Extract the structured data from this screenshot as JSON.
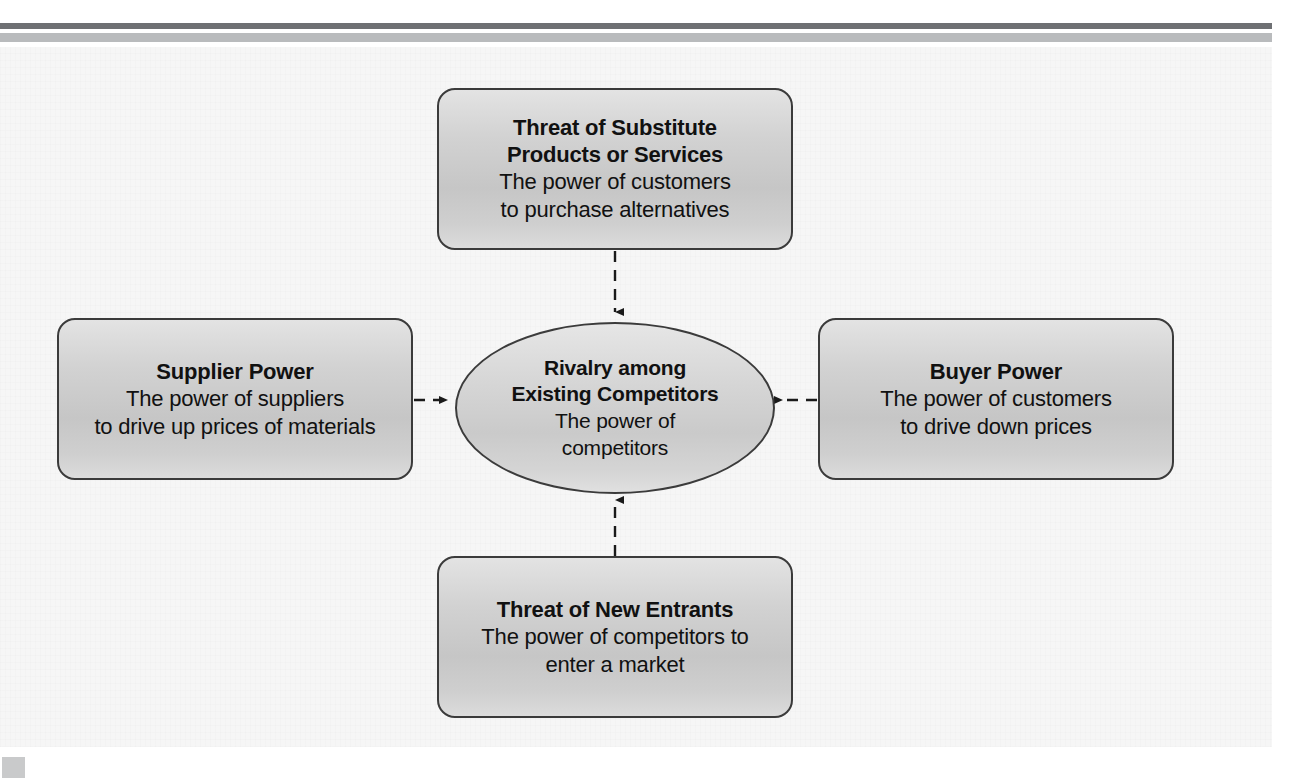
{
  "diagram": {
    "type": "porters-five-forces",
    "center": {
      "title_lines": [
        "Rivalry among",
        "Existing Competitors"
      ],
      "desc_lines": [
        "The power of",
        "competitors"
      ]
    },
    "nodes": [
      {
        "id": "top",
        "position": "top",
        "title_lines": [
          "Threat of Substitute",
          "Products or Services"
        ],
        "desc_lines": [
          "The power of customers",
          "to purchase alternatives"
        ],
        "arrow_direction": "down"
      },
      {
        "id": "left",
        "position": "left",
        "title_lines": [
          "Supplier Power"
        ],
        "desc_lines": [
          "The power of suppliers",
          "to drive up prices of materials"
        ],
        "arrow_direction": "right"
      },
      {
        "id": "right",
        "position": "right",
        "title_lines": [
          "Buyer Power"
        ],
        "desc_lines": [
          "The power of customers",
          "to drive down prices"
        ],
        "arrow_direction": "left"
      },
      {
        "id": "bottom",
        "position": "bottom",
        "title_lines": [
          "Threat of New Entrants"
        ],
        "desc_lines": [
          "The power of competitors to",
          "enter a market"
        ],
        "arrow_direction": "up"
      }
    ],
    "connector_style": "dashed-arrow",
    "colors": {
      "node_border": "#3b3b3b",
      "node_fill_top": "#e3e3e3",
      "node_fill_bottom": "#c6c6c6",
      "connector": "#1a1a1a",
      "rule_dark": "#6e7073",
      "rule_light": "#b9bbbd",
      "panel_background": "#f6f6f6",
      "corner_marker": "#c9cacb"
    }
  }
}
